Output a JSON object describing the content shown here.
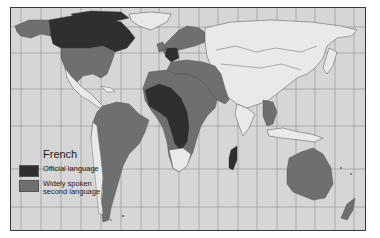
{
  "map": {
    "title": "French",
    "colors": {
      "ocean": "#d6d6d6",
      "land_other": "#e9e9e9",
      "official_language": "#2f2f2f",
      "second_language": "#6f6f6f",
      "grid": "#8a8a8a",
      "frame": "#3a3a3a"
    }
  },
  "legend": {
    "title": "French",
    "items": [
      {
        "label": "Official language",
        "color": "#2f2f2f"
      },
      {
        "label": "Widely spoken\nsecond language",
        "color": "#6f6f6f"
      }
    ]
  }
}
